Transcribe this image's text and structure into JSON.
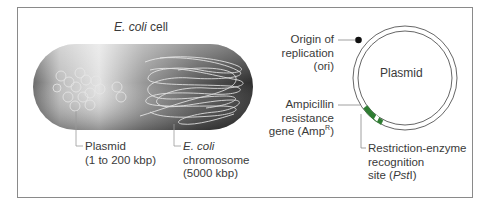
{
  "panel_left": {
    "title_italic": "E. coli",
    "title_rest": " cell",
    "plasmid_label": {
      "line1": "Plasmid",
      "line2": "(1 to 200 kbp)"
    },
    "chromosome_label": {
      "line1_italic": "E. coli",
      "line2": "chromosome",
      "line3": "(5000 kbp)"
    }
  },
  "panel_right": {
    "center_label": "Plasmid",
    "ori_label": {
      "line1": "Origin of",
      "line2": "replication",
      "line3": "(ori)"
    },
    "amp_label": {
      "line1": "Ampicillin",
      "line2": "resistance",
      "line3_pre": "gene (Amp",
      "line3_sup": "R",
      "line3_post": ")"
    },
    "pst_label": {
      "line1": "Restriction-enzyme",
      "line2": "recognition",
      "line3_pre": "site (",
      "line3_italic": "Pst",
      "line3_post": "I)"
    }
  },
  "colors": {
    "frame": "#8a8a8a",
    "gene_green": "#2e7d32",
    "ori_marker": "#111111",
    "cell_dark": "#3c3c3c",
    "cell_light": "#d8d8d8"
  }
}
